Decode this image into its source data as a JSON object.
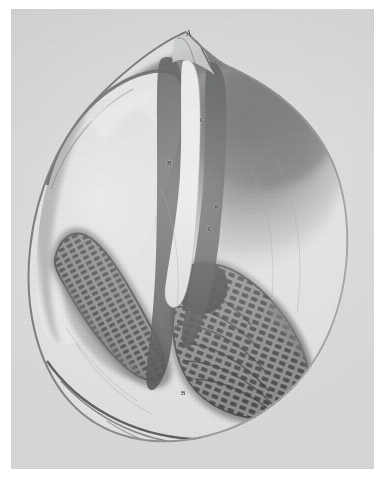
{
  "plate": {
    "kind": "engraving-plate",
    "medium": "monochrome lithograph / halftone scientific plate",
    "subject": "dissected bivalve mollusc showing mantle, gill lamellae and median cleft",
    "paper_color": "#d9dada",
    "ink_color": "#2b2b2b",
    "margin_color": "#ffffff"
  },
  "labels": [
    {
      "id": "A",
      "text": "A",
      "x": 186,
      "y": 30,
      "size": 7.5,
      "style": "cap",
      "note": "apex / umbo of the specimen, top centre"
    },
    {
      "id": "C1",
      "text": "C",
      "x": 200,
      "y": 117,
      "size": 6.5,
      "style": "cap",
      "note": "upper part of the median cleft"
    },
    {
      "id": "B1",
      "text": "B",
      "x": 167,
      "y": 160,
      "size": 6.5,
      "style": "cap",
      "note": "left mantle margin beside the cleft"
    },
    {
      "id": "a",
      "text": "a",
      "x": 215,
      "y": 203,
      "size": 6,
      "style": "ital",
      "note": "right inner surface midway down"
    },
    {
      "id": "C2",
      "text": "C",
      "x": 208,
      "y": 226,
      "size": 6.5,
      "style": "cap",
      "note": "lower part of the median cleft"
    },
    {
      "id": "B2",
      "text": "B",
      "x": 181,
      "y": 390,
      "size": 6.5,
      "style": "cap",
      "note": "lower left edge of the right gill mass"
    }
  ],
  "corner_marks": [
    {
      "id": "top-right-mark",
      "text": "·",
      "x": 354,
      "y": 1,
      "note": "faint plate number / scan artefact, upper right margin"
    },
    {
      "id": "bottom-right-mark",
      "text": "·",
      "x": 366,
      "y": 441,
      "note": "faint scan artefact, lower right of plate"
    }
  ],
  "figure": {
    "name": "specimen",
    "outline_name": "specimen-outline",
    "parts": [
      {
        "name": "shell-outline",
        "desc": "near-circular shell / body outline occupying most of the plate"
      },
      {
        "name": "apex-beak",
        "desc": "pointed beak rising at the top centre, labelled A"
      },
      {
        "name": "median-cleft",
        "desc": "pale vertical groove running from the apex down the centre, labelled C twice"
      },
      {
        "name": "left-mantle-lobe",
        "desc": "pale curved lobe occupying the upper left interior"
      },
      {
        "name": "left-gill-lamellae",
        "desc": "dark hatched/segmented band curving through the lower left quadrant"
      },
      {
        "name": "right-gill-lamellae",
        "desc": "dark hatched/segmented mass filling the lower right quadrant, labelled B"
      },
      {
        "name": "right-dark-field",
        "desc": "broad dark shaded region of the upper right interior"
      },
      {
        "name": "ventral-margin",
        "desc": "the thin curved lip and fold along the bottom of the shell"
      }
    ]
  }
}
